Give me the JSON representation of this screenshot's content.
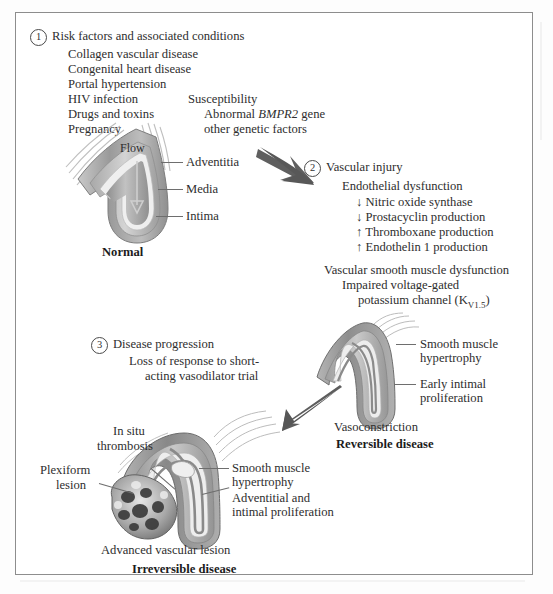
{
  "figure": {
    "title_hidden": "",
    "border_color": "#8d8d8d",
    "ink_color": "#2e2e2e",
    "arrow_color": "#5a5a5a"
  },
  "steps": {
    "one": {
      "marker": "1",
      "heading": "Risk factors and associated conditions",
      "items": [
        "Collagen vascular disease",
        "Congenital heart disease",
        "Portal hypertension",
        "HIV infection",
        "Drugs and toxins",
        "Pregnancy"
      ]
    },
    "two": {
      "marker": "2",
      "heading": "Vascular injury",
      "subheading_a": "Endothelial dysfunction",
      "items_a": [
        "↓ Nitric oxide synthase",
        "↓ Prostacyclin production",
        "↑ Thromboxane production",
        "↑ Endothelin 1 production"
      ],
      "subheading_b": "Vascular smooth muscle dysfunction",
      "items_b_line1": "Impaired voltage-gated",
      "items_b_line2_pre": "potassium channel (K",
      "items_b_line2_sub": "V1.5",
      "items_b_line2_post": ")"
    },
    "three": {
      "marker": "3",
      "heading": "Disease progression",
      "line1": "Loss of response to short-",
      "line2": "acting vasodilator trial"
    }
  },
  "susceptibility": {
    "heading": "Susceptibility",
    "line1_pre": "Abnormal ",
    "line1_gene": "BMPR2",
    "line1_post": " gene",
    "line2": "other genetic factors"
  },
  "normal_vessel": {
    "flow_label": "Flow",
    "labels": [
      "Adventitia",
      "Media",
      "Intima"
    ],
    "caption": "Normal"
  },
  "reversible_vessel": {
    "labels": [
      {
        "line1": "Smooth muscle",
        "line2": "hypertrophy"
      },
      {
        "line1": "Early intimal",
        "line2": "proliferation"
      }
    ],
    "caption": "Vasoconstriction",
    "caption_bold": "Reversible disease"
  },
  "irreversible_vessel": {
    "label_in_situ_line1": "In situ",
    "label_in_situ_line2": "thrombosis",
    "label_plexiform_line1": "Plexiform",
    "label_plexiform_line2": "lesion",
    "label_smooth_line1": "Smooth muscle",
    "label_smooth_line2": "hypertrophy",
    "label_adventitial_line1": "Adventitial and",
    "label_adventitial_line2": "intimal proliferation",
    "caption": "Advanced vascular lesion",
    "caption_bold": "Irreversible disease"
  }
}
